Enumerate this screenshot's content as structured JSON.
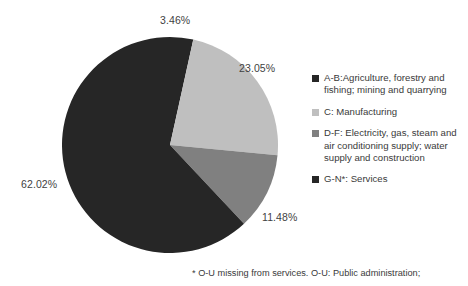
{
  "chart_data": {
    "type": "pie",
    "title": "",
    "categories": [
      "A-B:Agriculture, forestry and fishing; mining and quarrying",
      "C: Manufacturing",
      "D-F: Electricity, gas, steam and air conditioning supply; water supply and construction",
      "G-N*: Services"
    ],
    "values": [
      3.46,
      23.05,
      11.48,
      62.02
    ],
    "value_labels": [
      "3.46%",
      "23.05%",
      "11.48%",
      "62.02%"
    ],
    "colors": [
      "#262626",
      "#bfbfbf",
      "#808080",
      "#262626"
    ],
    "legend_position": "right",
    "start_angle": 0,
    "direction": "clockwise",
    "grid": false,
    "xlabel": "",
    "ylabel": ""
  },
  "legend": {
    "items": [
      {
        "label": "A-B:Agriculture, forestry and fishing; mining and quarrying",
        "color": "#262626"
      },
      {
        "label": "C: Manufacturing",
        "color": "#bfbfbf"
      },
      {
        "label": "D-F: Electricity, gas, steam and air conditioning supply; water supply and construction",
        "color": "#808080"
      },
      {
        "label": "G-N*: Services",
        "color": "#262626"
      }
    ]
  },
  "labels": {
    "slice_ab": "3.46%",
    "slice_c": "23.05%",
    "slice_df": "11.48%",
    "slice_gn": "62.02%"
  },
  "footnote": {
    "text": "* O-U missing from services. O-U: Public administration;"
  }
}
